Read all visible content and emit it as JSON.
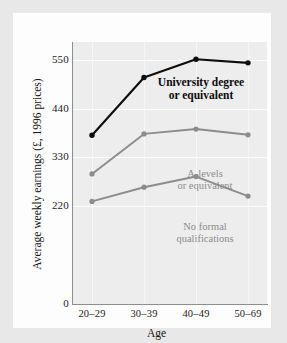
{
  "chart_data": {
    "type": "line",
    "title": "",
    "xlabel": "Age",
    "ylabel": "Average weekly earnings (£, 1996 prices)",
    "categories": [
      "20–29",
      "30–39",
      "40–49",
      "50–69"
    ],
    "yticks": [
      0,
      220,
      330,
      440,
      550
    ],
    "ytick_labels": [
      "0",
      "220",
      "330",
      "440",
      "550"
    ],
    "ylim": [
      0,
      590
    ],
    "grid": true,
    "legend_position": "inline-annotations",
    "series": [
      {
        "name": "University degree or equivalent",
        "label_line1": "University degree",
        "label_line2": "or equivalent",
        "color": "#0d0d0d",
        "values": [
          380,
          510,
          551,
          543
        ]
      },
      {
        "name": "A-levels or equivalent",
        "label_line1": "A-levels",
        "label_line2": "or equivalent",
        "color": "#8c8c8c",
        "values": [
          293,
          383,
          394,
          381
        ]
      },
      {
        "name": "No formal qualifications",
        "label_line1": "No formal",
        "label_line2": "qualifications",
        "color": "#8c8c8c",
        "values": [
          231,
          263,
          287,
          243
        ]
      }
    ]
  },
  "colors": {
    "page_background": "#e8e8e9",
    "panel": "#fdfdfd",
    "plot_background": "#ededee",
    "axis": "#8e8e8e",
    "gridline": "#fbfbfb",
    "text": "#1b1b1b",
    "series_dark": "#0d0d0d",
    "series_gray": "#8c8c8c"
  }
}
